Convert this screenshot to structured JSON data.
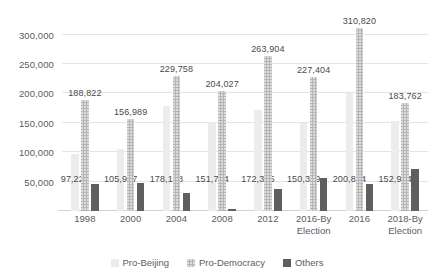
{
  "chart_data": {
    "type": "bar",
    "title": "",
    "subtitle": "",
    "xlabel": "",
    "ylabel": "",
    "ylim": [
      0,
      325000
    ],
    "yticks": [
      50000,
      100000,
      150000,
      200000,
      250000,
      300000
    ],
    "ytick_labels": [
      "50,000",
      "100,000",
      "150,000",
      "200,000",
      "250,000",
      "300,000"
    ],
    "grid": true,
    "legend_position": "bottom",
    "categories": [
      "1998",
      "2000",
      "2004",
      "2008",
      "2012",
      "2016-By\nElection",
      "2016",
      "2018-By\nElection"
    ],
    "series": [
      {
        "name": "Pro-Beijing",
        "color": "#ececed",
        "values": [
          97226,
          105947,
          178168,
          151764,
          172385,
          150329,
          200814,
          152904
        ],
        "labels": [
          "97,226",
          "105,947",
          "178,168",
          "151,764",
          "172,385",
          "150,329",
          "200,814",
          "152,904"
        ],
        "label_position": "inside-low"
      },
      {
        "name": "Pro-Democracy",
        "color": "#b5b5b5",
        "values": [
          188822,
          156989,
          229758,
          204027,
          263904,
          227404,
          310820,
          183762
        ],
        "labels": [
          "188,822",
          "156,989",
          "229,758",
          "204,027",
          "263,904",
          "227,404",
          "310,820",
          "183,762"
        ],
        "label_position": "above"
      },
      {
        "name": "Others",
        "color": "#5f5f5f",
        "values": [
          46000,
          47000,
          31000,
          3500,
          38000,
          56000,
          46000,
          72000
        ],
        "labels": [
          "",
          "",
          "",
          "",
          "",
          "",
          "",
          ""
        ],
        "label_position": "none"
      }
    ]
  },
  "legend": {
    "items": [
      {
        "label": "Pro-Beijing"
      },
      {
        "label": "Pro-Democracy"
      },
      {
        "label": "Others"
      }
    ]
  }
}
